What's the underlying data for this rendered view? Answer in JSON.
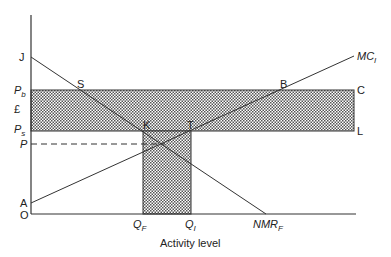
{
  "diagram": {
    "xlabel": "Activity level",
    "currency_label": "£",
    "origin_label": "O",
    "points": {
      "J": "J",
      "S": "S",
      "B": "B",
      "C": "C",
      "K": "K",
      "T": "T",
      "L": "L",
      "A": "A"
    },
    "price_labels": {
      "Pb_main": "P",
      "Pb_sub": "b",
      "Ps_main": "P",
      "Ps_sub": "s",
      "P": "P"
    },
    "quantity_labels": {
      "QF_main": "Q",
      "QF_sub": "F",
      "QI_main": "Q",
      "QI_sub": "I"
    },
    "curves": {
      "MC_main": "MC",
      "MC_sub": "I",
      "NMR_main": "NMR",
      "NMR_sub": "F"
    },
    "colors": {
      "line": "#333333",
      "shade_dot": "#555555",
      "background": "#ffffff"
    }
  }
}
